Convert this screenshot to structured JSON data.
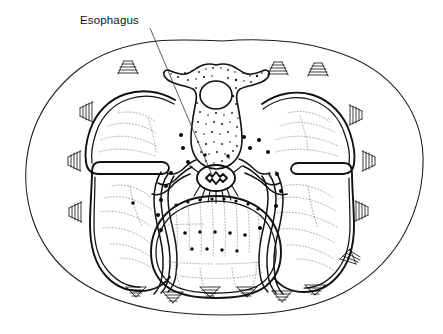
{
  "figure": {
    "type": "anatomical-line-drawing",
    "background_color": "#ffffff",
    "ink_color": "#111111",
    "faint_ink_color": "#8d8d8d",
    "width": 443,
    "height": 334
  },
  "labels": [
    {
      "id": "esophagus",
      "text": "Esophagus",
      "text_x": 80,
      "text_y": 24,
      "leader_from": [
        150,
        28
      ],
      "leader_to": [
        212,
        175
      ]
    }
  ],
  "structures": {
    "body_wall": {
      "name": "body-wall-outline",
      "note": "irregular oval torso outline"
    },
    "vertebra": {
      "name": "thoracic-vertebra",
      "note": "stippled vertebral body with transverse processes and oval spinal canal"
    },
    "spinal_canal": {
      "name": "spinal-canal",
      "note": "oval lucency within vertebra"
    },
    "esophagus": {
      "name": "esophagus-lumen",
      "note": "small star-shaped lumen anterior to vertebra"
    },
    "left_lung": {
      "name": "left-lung",
      "note": "double-contoured lung field with horizontal fissure"
    },
    "right_lung": {
      "name": "right-lung",
      "note": "double-contoured lung field with horizontal fissure"
    },
    "heart": {
      "name": "heart-pericardium",
      "note": "rounded central inferior structure, stippled"
    },
    "ribs": {
      "name": "rib-cross-sections",
      "note": "triangular hatched marks around the periphery"
    },
    "mediastinal_fibers": {
      "name": "mediastinal-radiating-fibers",
      "note": "lines radiating from esophagus"
    }
  },
  "counts": {
    "rib_hatch_marks": 16,
    "label_count": 1
  }
}
